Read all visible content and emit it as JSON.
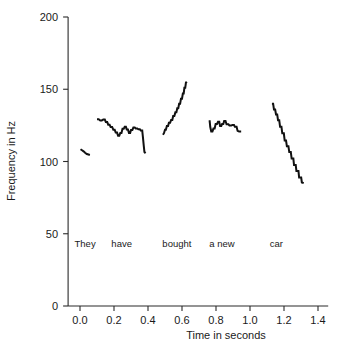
{
  "chart_data": {
    "type": "line",
    "title": "",
    "xlabel": "Time in seconds",
    "ylabel": "Frequency in Hz",
    "xlim": [
      -0.07,
      1.46
    ],
    "ylim": [
      0,
      200
    ],
    "xticks": [
      0.0,
      0.2,
      0.4,
      0.6,
      0.8,
      1.0,
      1.2,
      1.4
    ],
    "xticklabels": [
      "0.0",
      "0.2",
      "0.4",
      "0.6",
      "0.8",
      "1.0",
      "1.2",
      "1.4"
    ],
    "yticks": [
      0,
      50,
      100,
      150,
      200
    ],
    "yticklabels": [
      "0",
      "50",
      "100",
      "150",
      "200"
    ],
    "grid": false,
    "legend": false,
    "annotations": [
      {
        "text": "They",
        "x": 0.03,
        "y": 41
      },
      {
        "text": "have",
        "x": 0.245,
        "y": 41
      },
      {
        "text": "bought",
        "x": 0.57,
        "y": 41
      },
      {
        "text": "a new",
        "x": 0.835,
        "y": 41
      },
      {
        "text": "car",
        "x": 1.155,
        "y": 41
      }
    ],
    "series": [
      {
        "name": "They",
        "points": [
          [
            0.003,
            108.5
          ],
          [
            0.012,
            107.8
          ],
          [
            0.021,
            107.0
          ],
          [
            0.03,
            106.0
          ],
          [
            0.04,
            105.2
          ],
          [
            0.05,
            104.8
          ],
          [
            0.058,
            104.5
          ]
        ]
      },
      {
        "name": "have",
        "points": [
          [
            0.1,
            129.2
          ],
          [
            0.11,
            129.2
          ],
          [
            0.119,
            128.4
          ],
          [
            0.128,
            128.4
          ],
          [
            0.137,
            129.0
          ],
          [
            0.146,
            129.0
          ],
          [
            0.152,
            127.3
          ],
          [
            0.16,
            127.3
          ],
          [
            0.166,
            125.5
          ],
          [
            0.174,
            125.5
          ],
          [
            0.18,
            123.9
          ],
          [
            0.189,
            123.9
          ],
          [
            0.196,
            122.0
          ],
          [
            0.204,
            122.0
          ],
          [
            0.21,
            120.0
          ],
          [
            0.218,
            120.0
          ],
          [
            0.224,
            117.8
          ],
          [
            0.231,
            117.8
          ],
          [
            0.237,
            119.8
          ],
          [
            0.244,
            119.8
          ],
          [
            0.25,
            122.6
          ],
          [
            0.257,
            122.6
          ],
          [
            0.263,
            124.0
          ],
          [
            0.27,
            124.0
          ],
          [
            0.275,
            122.2
          ],
          [
            0.282,
            122.2
          ],
          [
            0.288,
            119.8
          ],
          [
            0.295,
            119.8
          ],
          [
            0.3,
            121.8
          ],
          [
            0.308,
            121.8
          ],
          [
            0.314,
            123.5
          ],
          [
            0.322,
            123.5
          ],
          [
            0.328,
            122.8
          ],
          [
            0.337,
            122.8
          ],
          [
            0.343,
            122.3
          ],
          [
            0.352,
            122.3
          ],
          [
            0.357,
            121.5
          ],
          [
            0.366,
            121.5
          ],
          [
            0.37,
            117.0
          ],
          [
            0.375,
            111.0
          ],
          [
            0.379,
            106.5
          ],
          [
            0.386,
            105.8
          ]
        ]
      },
      {
        "name": "bought",
        "points": [
          [
            0.488,
            118.5
          ],
          [
            0.494,
            119.6
          ],
          [
            0.5,
            122.0
          ],
          [
            0.505,
            122.0
          ],
          [
            0.511,
            124.5
          ],
          [
            0.518,
            124.5
          ],
          [
            0.523,
            126.8
          ],
          [
            0.53,
            126.8
          ],
          [
            0.536,
            128.8
          ],
          [
            0.543,
            128.8
          ],
          [
            0.548,
            131.5
          ],
          [
            0.555,
            131.5
          ],
          [
            0.561,
            134.0
          ],
          [
            0.567,
            134.0
          ],
          [
            0.572,
            136.8
          ],
          [
            0.578,
            136.8
          ],
          [
            0.583,
            140.0
          ],
          [
            0.589,
            140.0
          ],
          [
            0.594,
            143.5
          ],
          [
            0.6,
            143.5
          ],
          [
            0.605,
            147.0
          ],
          [
            0.61,
            147.0
          ],
          [
            0.614,
            151.0
          ],
          [
            0.619,
            151.0
          ],
          [
            0.623,
            154.5
          ],
          [
            0.628,
            155.2
          ]
        ]
      },
      {
        "name": "a new",
        "points": [
          [
            0.757,
            127.8
          ],
          [
            0.763,
            127.8
          ],
          [
            0.766,
            124.0
          ],
          [
            0.772,
            120.8
          ],
          [
            0.779,
            120.8
          ],
          [
            0.785,
            122.8
          ],
          [
            0.792,
            122.8
          ],
          [
            0.798,
            126.0
          ],
          [
            0.806,
            126.0
          ],
          [
            0.812,
            127.5
          ],
          [
            0.819,
            127.5
          ],
          [
            0.824,
            124.5
          ],
          [
            0.831,
            124.5
          ],
          [
            0.836,
            126.0
          ],
          [
            0.843,
            126.0
          ],
          [
            0.848,
            128.0
          ],
          [
            0.856,
            128.0
          ],
          [
            0.862,
            125.8
          ],
          [
            0.873,
            125.8
          ],
          [
            0.879,
            125.0
          ],
          [
            0.89,
            125.0
          ],
          [
            0.896,
            125.2
          ],
          [
            0.906,
            125.2
          ],
          [
            0.911,
            124.0
          ],
          [
            0.921,
            124.0
          ],
          [
            0.927,
            121.2
          ],
          [
            0.936,
            120.8
          ],
          [
            0.948,
            120.8
          ]
        ]
      },
      {
        "name": "car",
        "points": [
          [
            1.129,
            140.0
          ],
          [
            1.136,
            140.0
          ],
          [
            1.141,
            136.0
          ],
          [
            1.148,
            136.0
          ],
          [
            1.153,
            132.5
          ],
          [
            1.16,
            132.5
          ],
          [
            1.165,
            128.5
          ],
          [
            1.172,
            128.5
          ],
          [
            1.177,
            124.0
          ],
          [
            1.185,
            124.0
          ],
          [
            1.19,
            119.5
          ],
          [
            1.199,
            119.5
          ],
          [
            1.204,
            114.5
          ],
          [
            1.212,
            114.5
          ],
          [
            1.217,
            110.5
          ],
          [
            1.226,
            110.5
          ],
          [
            1.231,
            106.5
          ],
          [
            1.24,
            106.5
          ],
          [
            1.245,
            102.0
          ],
          [
            1.255,
            102.0
          ],
          [
            1.259,
            97.5
          ],
          [
            1.269,
            97.5
          ],
          [
            1.273,
            93.5
          ],
          [
            1.285,
            93.5
          ],
          [
            1.289,
            89.0
          ],
          [
            1.301,
            89.0
          ],
          [
            1.305,
            85.5
          ],
          [
            1.316,
            85.0
          ]
        ]
      }
    ]
  }
}
